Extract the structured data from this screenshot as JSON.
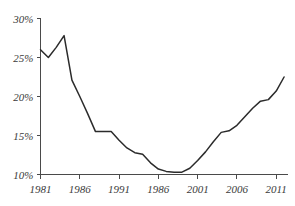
{
  "title_remnant": "",
  "chart_data": {
    "type": "line",
    "title": "",
    "subtitle": "",
    "xlabel": "",
    "ylabel": "",
    "xlim": [
      1981,
      2012.5
    ],
    "ylim": [
      10,
      30
    ],
    "grid": false,
    "legend": false,
    "legend_position": "none",
    "y_ticks": [
      10,
      15,
      20,
      25,
      30
    ],
    "y_tick_labels": [
      "10%",
      "15%",
      "20%",
      "25%",
      "30%"
    ],
    "x_ticks": [
      1981,
      1986,
      1991,
      1996,
      2001,
      2006,
      2011
    ],
    "x_tick_labels": [
      "1981",
      "1986",
      "1991",
      "1986",
      "2001",
      "2006",
      "2011"
    ],
    "line_color": "#2b2b2b",
    "axis_color": "#4a4a4a",
    "series": [
      {
        "name": "value",
        "x": [
          1981,
          1982,
          1983,
          1984,
          1985,
          1986,
          1987,
          1988,
          1989,
          1990,
          1991,
          1992,
          1993,
          1994,
          1995,
          1996,
          1997,
          1998,
          1999,
          2000,
          2001,
          2002,
          2003,
          2004,
          2005,
          2006,
          2007,
          2008,
          2009,
          2010,
          2011,
          2012
        ],
        "values": [
          26.0,
          25.0,
          26.3,
          27.8,
          22.1,
          20.0,
          17.8,
          15.5,
          15.5,
          15.5,
          14.4,
          13.4,
          12.8,
          12.6,
          11.5,
          10.7,
          10.4,
          10.3,
          10.3,
          10.8,
          11.8,
          12.9,
          14.2,
          15.4,
          15.6,
          16.3,
          17.4,
          18.5,
          19.4,
          19.6,
          20.7,
          22.5
        ]
      }
    ]
  }
}
